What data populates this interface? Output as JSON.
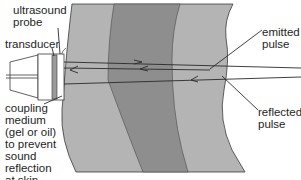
{
  "diagram": {
    "type": "ultrasound imaging schematic",
    "colors": {
      "background": "#ffffff",
      "tissue_light": "#b4b4b4",
      "tissue_dark": "#8e8e8e",
      "outline": "#3a3a3a",
      "text": "#1e1e1e"
    },
    "labels": {
      "probe": "ultrasound\nprobe",
      "transducer": "transducer",
      "coupling": "coupling\nmedium\n(gel or oil)\nto prevent\nsound\nreflection\nat skin",
      "emitted": "emitted\npulse",
      "reflected": "reflected\npulse"
    }
  }
}
